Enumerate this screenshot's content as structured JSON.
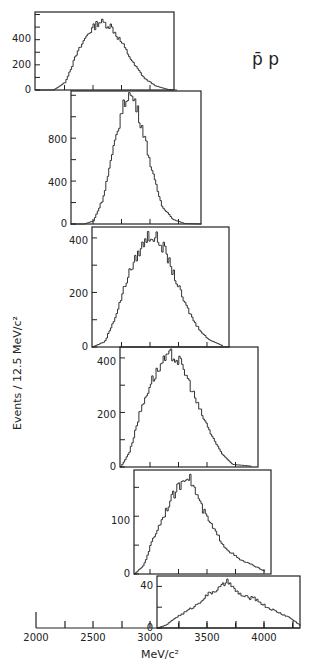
{
  "chart_data": {
    "type": "bar",
    "style": "stacked-offset histograms (step outlines)",
    "title": "p̄ p",
    "ylabel": "Events / 12.5 MeV/c²",
    "xlabel": "MeV/c²",
    "bin_width": 12.5,
    "x_axis": {
      "ticks": [
        2000,
        2250,
        2500,
        2750,
        3000,
        3250,
        3500,
        3750,
        4000,
        4250
      ],
      "tick_labels": [
        "2000",
        "2500",
        "3000",
        "3500",
        "4000"
      ]
    },
    "panels": [
      {
        "id": 1,
        "xlim": [
          2000,
          3230
        ],
        "ylim": [
          0,
          620
        ],
        "ytick_labels": [
          "0",
          "200",
          "400"
        ],
        "x": [
          2000,
          2150,
          2250,
          2350,
          2450,
          2550,
          2650,
          2750,
          2850,
          2950,
          3050,
          3150,
          3230
        ],
        "values": [
          0,
          0,
          60,
          280,
          450,
          545,
          510,
          370,
          210,
          90,
          30,
          5,
          0
        ]
      },
      {
        "id": 2,
        "xlim": [
          2300,
          3440
        ],
        "ylim": [
          0,
          1240
        ],
        "ytick_labels": [
          "0",
          "400",
          "800"
        ],
        "x": [
          2300,
          2420,
          2500,
          2580,
          2660,
          2740,
          2800,
          2860,
          2940,
          3020,
          3100,
          3200,
          3300,
          3440
        ],
        "values": [
          0,
          0,
          30,
          230,
          620,
          1020,
          1220,
          1150,
          850,
          460,
          170,
          40,
          5,
          0
        ]
      },
      {
        "id": 3,
        "xlim": [
          2490,
          3630
        ],
        "ylim": [
          0,
          440
        ],
        "ytick_labels": [
          "0",
          "200",
          "400"
        ],
        "x": [
          2490,
          2600,
          2700,
          2800,
          2900,
          2980,
          3050,
          3120,
          3200,
          3300,
          3400,
          3500,
          3630
        ],
        "values": [
          0,
          20,
          120,
          260,
          350,
          410,
          400,
          360,
          270,
          160,
          80,
          30,
          5
        ]
      },
      {
        "id": 3.5,
        "note": "fourth panel",
        "xlim": [
          2740,
          3880
        ],
        "ylim": [
          0,
          440
        ],
        "ytick_labels": [
          "0",
          "200",
          "400"
        ],
        "x": [
          2740,
          2820,
          2900,
          3000,
          3100,
          3180,
          3250,
          3320,
          3420,
          3520,
          3620,
          3720,
          3880
        ],
        "values": [
          0,
          60,
          190,
          310,
          380,
          410,
          390,
          330,
          220,
          130,
          50,
          10,
          3
        ]
      },
      {
        "id": 5,
        "xlim": [
          2860,
          4000
        ],
        "ylim": [
          0,
          180
        ],
        "ytick_labels": [
          "0",
          "100"
        ],
        "x": [
          2860,
          2940,
          3020,
          3100,
          3180,
          3260,
          3320,
          3380,
          3460,
          3560,
          3660,
          3780,
          3900,
          4000
        ],
        "values": [
          0,
          15,
          60,
          95,
          130,
          155,
          175,
          150,
          110,
          75,
          45,
          25,
          15,
          5
        ]
      },
      {
        "id": 6,
        "xlim": [
          3060,
          4320
        ],
        "ylim": [
          0,
          50
        ],
        "ytick_labels": [
          "0",
          "40"
        ],
        "x": [
          3060,
          3140,
          3220,
          3300,
          3400,
          3500,
          3600,
          3680,
          3740,
          3820,
          3920,
          4020,
          4120,
          4220,
          4320
        ],
        "values": [
          0,
          3,
          10,
          15,
          22,
          32,
          38,
          45,
          36,
          30,
          28,
          20,
          15,
          10,
          2
        ]
      }
    ]
  },
  "labels": {
    "title": "p̄ p",
    "ylabel": "Events / 12.5 MeV/c²",
    "xlabel": "MeV/c²",
    "p1_y": [
      "0",
      "200",
      "400"
    ],
    "p2_y": [
      "0",
      "400",
      "800"
    ],
    "p3_y": [
      "0",
      "200",
      "400"
    ],
    "p4_y": [
      "0",
      "200",
      "400"
    ],
    "p5_y": [
      "0",
      "100"
    ],
    "p6_y": [
      "0",
      "40"
    ],
    "x_ticks": [
      "2000",
      "2500",
      "3000",
      "3500",
      "4000"
    ]
  }
}
